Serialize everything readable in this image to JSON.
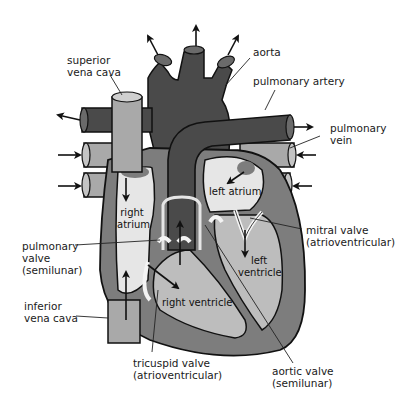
{
  "colors": {
    "background": "#ffffff",
    "dark_vessel": "#4a4a4a",
    "medium_tissue": "#7d7d7d",
    "light_vein": "#a9a9a9",
    "chamber_light": "#e6e6e6",
    "chamber_mid": "#bdbdbd",
    "outline": "#111111"
  },
  "labels": {
    "superior_vena_cava": [
      "superior",
      "vena cava"
    ],
    "aorta": "aorta",
    "pulmonary_artery": "pulmonary artery",
    "pulmonary_vein": [
      "pulmonary",
      "vein"
    ],
    "left_atrium": "left atrium",
    "right_atrium": [
      "right",
      "atrium"
    ],
    "mitral_valve": [
      "mitral valve",
      "(atrioventricular)"
    ],
    "pulmonary_valve": [
      "pulmonary",
      "valve",
      "(semilunar)"
    ],
    "left_ventricle": [
      "left",
      "ventricle"
    ],
    "inferior_vena_cava": [
      "inferior",
      "vena cava"
    ],
    "right_ventricle": "right ventricle",
    "tricuspid_valve": [
      "tricuspid valve",
      "(atrioventricular)"
    ],
    "aortic_valve": [
      "aortic valve",
      "(semilunar)"
    ]
  }
}
